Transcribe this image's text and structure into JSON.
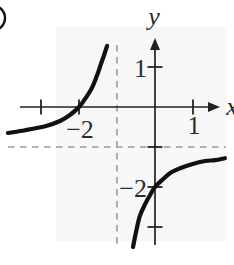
{
  "chart_data": {
    "type": "line",
    "title": "",
    "xlabel": "x",
    "ylabel": "y",
    "x_range": [
      -4.1,
      2.1
    ],
    "y_range": [
      -3.95,
      2.68
    ],
    "grid": false,
    "legend": false,
    "x_ticks": [
      {
        "value": -3,
        "label": ""
      },
      {
        "value": -2,
        "label": "−2"
      },
      {
        "value": 1,
        "label": "1"
      }
    ],
    "y_ticks": [
      {
        "value": 1,
        "label": "1"
      },
      {
        "value": -1,
        "label": ""
      },
      {
        "value": -2,
        "label": "−2"
      },
      {
        "value": -3,
        "label": ""
      }
    ],
    "asymptotes": {
      "vertical_x": -1,
      "horizontal_y": -1,
      "style": "dashed"
    },
    "intercepts": {
      "x_intercept": [
        -2,
        0
      ],
      "y_intercept": [
        0,
        -2
      ]
    },
    "series": [
      {
        "name": "left-branch",
        "points": [
          [
            -3.87,
            -0.65
          ],
          [
            -3.42,
            -0.58
          ],
          [
            -2.89,
            -0.48
          ],
          [
            -2.5,
            -0.35
          ],
          [
            -2.24,
            -0.2
          ],
          [
            -2,
            0
          ],
          [
            -1.82,
            0.23
          ],
          [
            -1.66,
            0.48
          ],
          [
            -1.53,
            0.78
          ],
          [
            -1.42,
            1.08
          ],
          [
            -1.34,
            1.3
          ],
          [
            -1.26,
            1.53
          ]
        ]
      },
      {
        "name": "right-branch",
        "points": [
          [
            -0.58,
            -3.5
          ],
          [
            -0.5,
            -3.13
          ],
          [
            -0.4,
            -2.73
          ],
          [
            -0.26,
            -2.43
          ],
          [
            -0.13,
            -2.2
          ],
          [
            0,
            -2
          ],
          [
            0.18,
            -1.83
          ],
          [
            0.4,
            -1.65
          ],
          [
            0.66,
            -1.53
          ],
          [
            0.97,
            -1.43
          ],
          [
            1.32,
            -1.35
          ],
          [
            1.58,
            -1.33
          ],
          [
            1.84,
            -1.28
          ]
        ]
      }
    ],
    "layout": {
      "origin_px": [
        155,
        107
      ],
      "px_per_unit": [
        38,
        40
      ]
    }
  },
  "colors": {
    "curve": "#111111",
    "axis": "#222222",
    "asymptote": "#9b9b9b",
    "label": "#2b2b2b",
    "background": "#ffffff",
    "plot_tint": "#f7f7f7"
  },
  "decorations": {
    "corner_fragment": "partial-circle"
  }
}
